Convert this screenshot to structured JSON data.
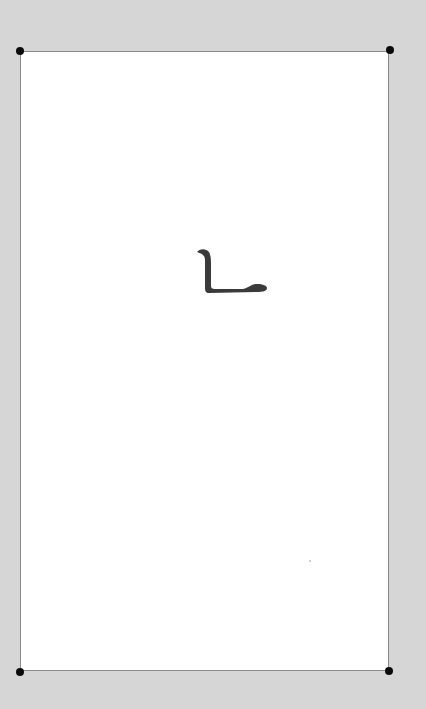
{
  "document": {
    "character": "ㄴ",
    "character_description": "Hangul letter nieun drawn in brush style",
    "colors": {
      "background": "#d6d6d6",
      "page": "#ffffff",
      "border": "#8a8a8a",
      "corner_handles": "#0a0a0a",
      "glyph": "#3a3a3a"
    }
  }
}
